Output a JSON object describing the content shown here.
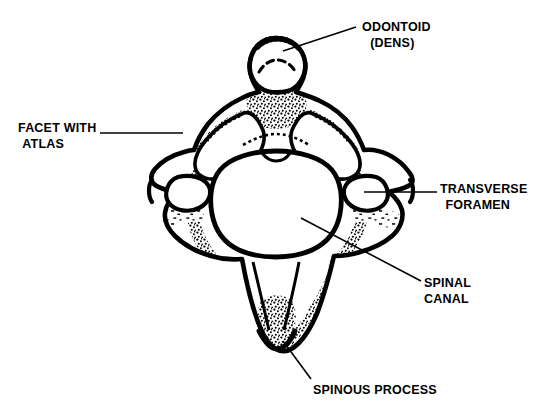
{
  "figure": {
    "background_color": "#ffffff",
    "ink_color": "#000000"
  },
  "labels": [
    {
      "id": "odontoid",
      "name": "odontoid-dens",
      "line1": "ODONTOID",
      "line2": "(DENS)"
    },
    {
      "id": "facet",
      "name": "facet-with-atlas",
      "line1": "FACET WITH",
      "line2": "ATLAS"
    },
    {
      "id": "transverse",
      "name": "transverse-foramen",
      "line1": "TRANSVERSE",
      "line2": "FORAMEN"
    },
    {
      "id": "spinal",
      "name": "spinal-canal",
      "line1": "SPINAL",
      "line2": "CANAL"
    },
    {
      "id": "spinous",
      "name": "spinous-process",
      "line1": "SPINOUS PROCESS",
      "line2": ""
    }
  ],
  "leader_lines": [
    {
      "name": "leader-odontoid",
      "x1": 356,
      "y1": 27,
      "x2": 283,
      "y2": 51
    },
    {
      "name": "leader-facet",
      "x1": 100,
      "y1": 133,
      "x2": 183,
      "y2": 133
    },
    {
      "name": "leader-transverse",
      "x1": 437,
      "y1": 192,
      "x2": 364,
      "y2": 192
    },
    {
      "name": "leader-spinal",
      "x1": 421,
      "y1": 281,
      "x2": 301,
      "y2": 218
    },
    {
      "name": "leader-spinous",
      "x1": 311,
      "y1": 379,
      "x2": 283,
      "y2": 341
    }
  ],
  "anatomy_parts": [
    {
      "name": "odontoid-process",
      "label_ref": "odontoid"
    },
    {
      "name": "superior-articular-facet-left",
      "label_ref": "facet"
    },
    {
      "name": "superior-articular-facet-right",
      "label_ref": null
    },
    {
      "name": "transverse-foramen-right",
      "label_ref": "transverse"
    },
    {
      "name": "transverse-foramen-left",
      "label_ref": null
    },
    {
      "name": "vertebral-foramen",
      "label_ref": "spinal"
    },
    {
      "name": "spinous-process",
      "label_ref": "spinous"
    },
    {
      "name": "transverse-process-left",
      "label_ref": null
    },
    {
      "name": "transverse-process-right",
      "label_ref": null
    }
  ]
}
